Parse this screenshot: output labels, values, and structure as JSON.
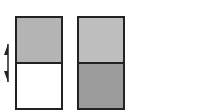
{
  "diagram": {
    "columns": [
      {
        "name": "left-column",
        "top_color": "#b4b4b4",
        "bottom_color": "#ffffff"
      },
      {
        "name": "right-column",
        "top_color": "#bebebe",
        "bottom_color": "#9c9c9c"
      }
    ],
    "arrow": {
      "type": "vertical-double-half-arrow",
      "color": "#222222"
    }
  }
}
